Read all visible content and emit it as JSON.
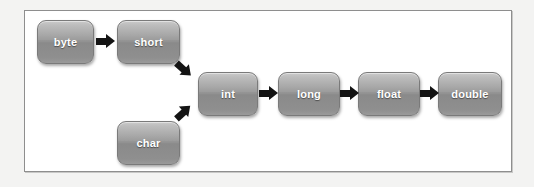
{
  "diagram": {
    "background_color": "#f3f3f2",
    "panel_color": "#ffffff",
    "panel_border_color": "#8e8e8e",
    "node_fill_top": "#b4b4b4",
    "node_fill_bottom": "#8a8a8a",
    "node_text_color": "#ffffff",
    "arrow_color": "#141414",
    "nodes": [
      {
        "id": "byte",
        "label": "byte",
        "x": 37,
        "y": 20,
        "w": 57,
        "h": 44,
        "row": "top"
      },
      {
        "id": "short",
        "label": "short",
        "x": 117,
        "y": 20,
        "w": 63,
        "h": 44,
        "row": "top"
      },
      {
        "id": "char",
        "label": "char",
        "x": 117,
        "y": 121,
        "w": 63,
        "h": 44,
        "row": "bottom"
      },
      {
        "id": "int",
        "label": "int",
        "x": 198,
        "y": 72,
        "w": 60,
        "h": 44,
        "row": "middle"
      },
      {
        "id": "long",
        "label": "long",
        "x": 278,
        "y": 72,
        "w": 62,
        "h": 44,
        "row": "middle"
      },
      {
        "id": "float",
        "label": "float",
        "x": 358,
        "y": 72,
        "w": 62,
        "h": 44,
        "row": "middle"
      },
      {
        "id": "double",
        "label": "double",
        "x": 438,
        "y": 72,
        "w": 64,
        "h": 44,
        "row": "middle"
      }
    ],
    "arrows": [
      {
        "id": "byte-to-short",
        "from": "byte",
        "to": "short",
        "direction": "right",
        "x": 96,
        "y": 34
      },
      {
        "id": "short-to-int",
        "from": "short",
        "to": "int",
        "direction": "down-right",
        "x": 174,
        "y": 62
      },
      {
        "id": "char-to-int",
        "from": "char",
        "to": "int",
        "direction": "up-right",
        "x": 174,
        "y": 105
      },
      {
        "id": "int-to-long",
        "from": "int",
        "to": "long",
        "direction": "right",
        "x": 259,
        "y": 86
      },
      {
        "id": "long-to-float",
        "from": "long",
        "to": "float",
        "direction": "right",
        "x": 340,
        "y": 86
      },
      {
        "id": "float-to-double",
        "from": "float",
        "to": "double",
        "direction": "right",
        "x": 420,
        "y": 86
      }
    ]
  }
}
